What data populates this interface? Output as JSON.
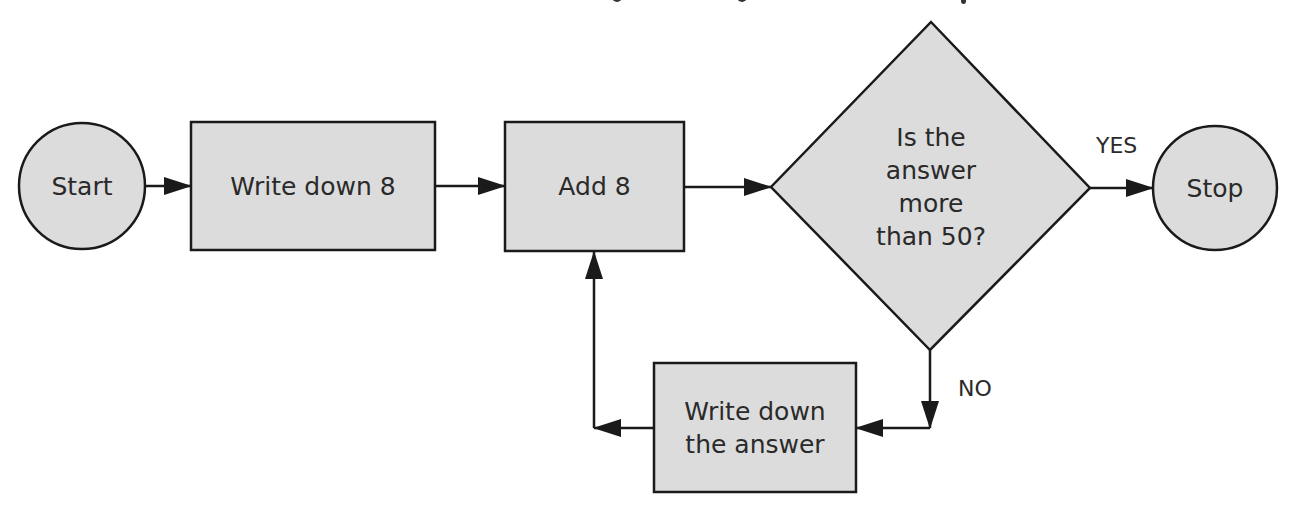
{
  "colors": {
    "fill": "#dcdcdc",
    "stroke": "#1a1a1a",
    "text": "#2a2a2a",
    "background": "#ffffff"
  },
  "title_fragment_visible": "(title text cut off at top edge — only descenders visible)",
  "nodes": [
    {
      "id": "start",
      "type": "terminal",
      "label": "Start"
    },
    {
      "id": "write8",
      "type": "process",
      "label": "Write down 8"
    },
    {
      "id": "add8",
      "type": "process",
      "label": "Add 8"
    },
    {
      "id": "decision",
      "type": "decision",
      "lines": [
        "Is the",
        "answer",
        "more",
        "than 50?"
      ]
    },
    {
      "id": "stop",
      "type": "terminal",
      "label": "Stop"
    },
    {
      "id": "writeans",
      "type": "process",
      "lines": [
        "Write down",
        "the answer"
      ]
    }
  ],
  "edges": [
    {
      "from": "start",
      "to": "write8",
      "label": ""
    },
    {
      "from": "write8",
      "to": "add8",
      "label": ""
    },
    {
      "from": "add8",
      "to": "decision",
      "label": ""
    },
    {
      "from": "decision",
      "to": "stop",
      "label": "YES"
    },
    {
      "from": "decision",
      "to": "writeans",
      "label": "NO"
    },
    {
      "from": "writeans",
      "to": "add8",
      "label": ""
    }
  ]
}
